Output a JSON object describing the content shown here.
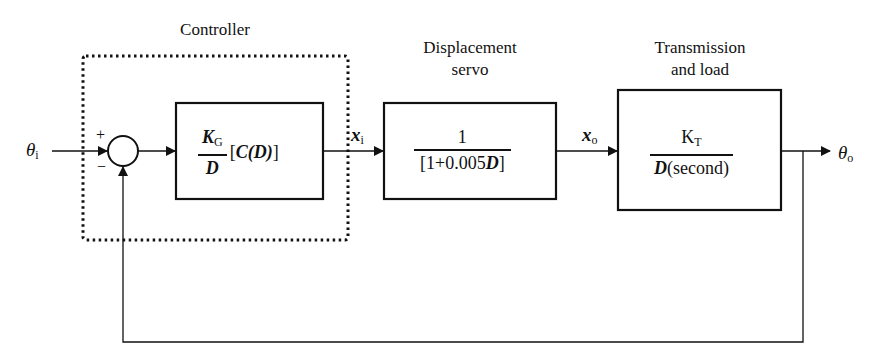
{
  "diagram": {
    "type": "block-diagram-feedback-loop",
    "input_signal": {
      "symbol": "θ",
      "subscript": "i"
    },
    "output_signal": {
      "symbol": "θ",
      "subscript": "o"
    },
    "summing_junction": {
      "plus_sign": "+",
      "minus_sign": "−"
    },
    "controller": {
      "title": "Controller",
      "gain_symbol": "K",
      "gain_subscript": "G",
      "denominator": "D",
      "factor": "[C(D)]",
      "factor_open": "[",
      "factor_body": "C(D)",
      "factor_close": "]"
    },
    "signal_xi": {
      "symbol": "x",
      "subscript": "i"
    },
    "displacement_servo": {
      "title_line1": "Displacement",
      "title_line2": "servo",
      "numerator": "1",
      "denominator_prefix": "[1+0.005",
      "denominator_var": "D",
      "denominator_suffix": "]"
    },
    "signal_xo": {
      "symbol": "x",
      "subscript": "o"
    },
    "transmission_load": {
      "title_line1": "Transmission",
      "title_line2": "and load",
      "numerator_symbol": "K",
      "numerator_subscript": "T",
      "denominator_var": "D",
      "denominator_suffix": "(second)"
    },
    "feedback": "unity negative feedback from θo to summing junction"
  }
}
